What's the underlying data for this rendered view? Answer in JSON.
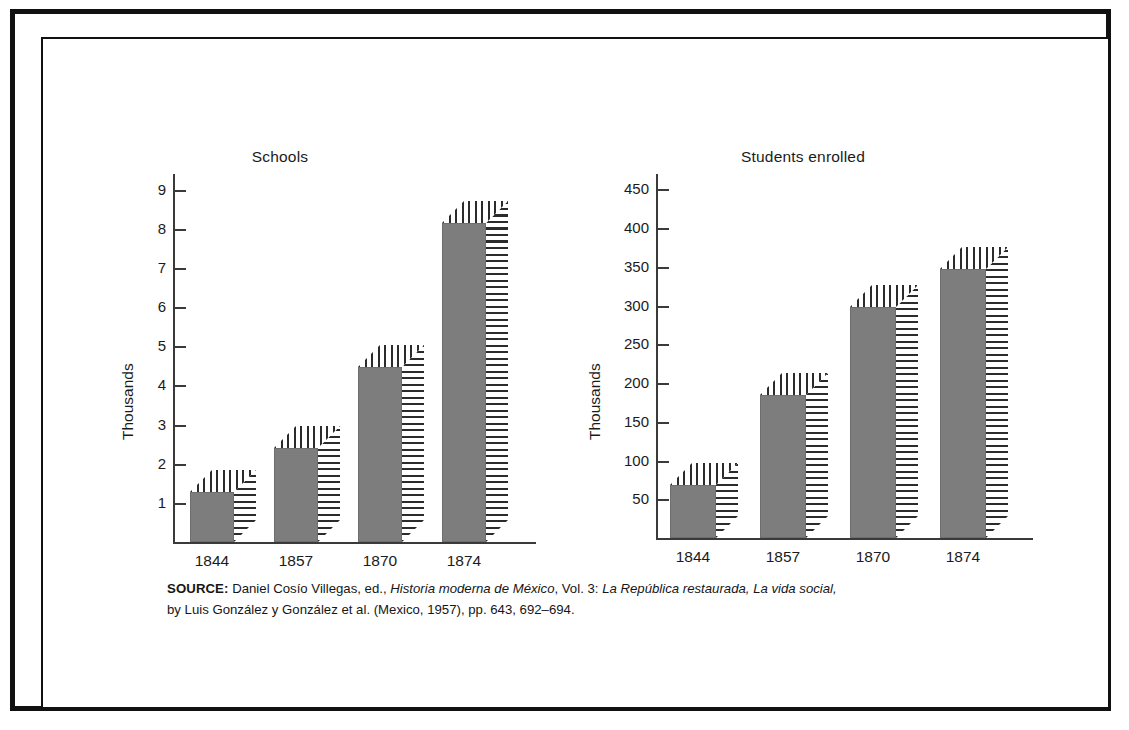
{
  "figure": {
    "source_note": {
      "label": "SOURCE:",
      "line1_a": " Daniel Cosío Villegas, ed., ",
      "line1_italic1": "Historia moderna de México",
      "line1_b": ", Vol. 3: ",
      "line1_italic2": "La República restaurada, La vida social,",
      "line2": "by Luis González y González et al. (Mexico, 1957), pp. 643, 692–694."
    }
  },
  "chart_data": [
    {
      "type": "bar",
      "title": "Schools",
      "xlabel": "",
      "ylabel": "Thousands",
      "categories": [
        "1844",
        "1857",
        "1870",
        "1874"
      ],
      "values": [
        1.27,
        2.4,
        4.48,
        8.15
      ],
      "tick_labels": [
        "1",
        "2",
        "3",
        "4",
        "5",
        "6",
        "7",
        "8",
        "9"
      ],
      "tick_values": [
        1,
        2,
        3,
        4,
        5,
        6,
        7,
        8,
        9
      ],
      "ylim": [
        0,
        9.4
      ],
      "grid": false,
      "legend": "none",
      "bar_color": "#7d7d7d",
      "hatch_color": "#2b2b2b"
    },
    {
      "type": "bar",
      "title": "Students enrolled",
      "xlabel": "",
      "ylabel": "Thousands",
      "categories": [
        "1844",
        "1857",
        "1870",
        "1874"
      ],
      "values": [
        68,
        184,
        298,
        347
      ],
      "tick_labels": [
        "50",
        "100",
        "150",
        "200",
        "250",
        "300",
        "350",
        "400",
        "450"
      ],
      "tick_values": [
        50,
        100,
        150,
        200,
        250,
        300,
        350,
        400,
        450
      ],
      "ylim": [
        0,
        470
      ],
      "grid": false,
      "legend": "none",
      "bar_color": "#7d7d7d",
      "hatch_color": "#2b2b2b"
    }
  ]
}
